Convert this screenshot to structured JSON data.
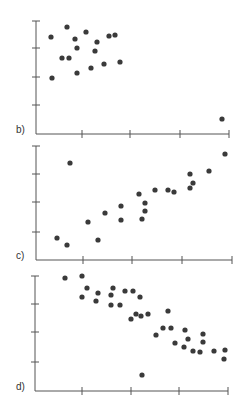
{
  "chart_data": [
    {
      "type": "scatter",
      "label": "b)",
      "title": "",
      "xlabel": "",
      "ylabel": "",
      "grid": false,
      "axis_px": {
        "x0": 36,
        "y0": 134,
        "x1": 229,
        "ytop": 21
      },
      "yticks_px": [
        21,
        48,
        77,
        105
      ],
      "xticks_px": [
        82,
        130,
        180,
        229
      ],
      "points_px": [
        [
          51,
          37
        ],
        [
          67,
          27
        ],
        [
          75,
          39
        ],
        [
          86,
          32
        ],
        [
          77,
          48
        ],
        [
          97,
          42
        ],
        [
          95,
          51
        ],
        [
          109,
          36
        ],
        [
          115,
          35
        ],
        [
          62,
          58
        ],
        [
          69,
          58
        ],
        [
          77,
          73
        ],
        [
          91,
          68
        ],
        [
          104,
          64
        ],
        [
          120,
          62
        ],
        [
          52,
          78
        ],
        [
          222,
          119
        ]
      ],
      "description": "Cluster of points in upper-left with one outlier at lower-right"
    },
    {
      "type": "scatter",
      "label": "c)",
      "title": "",
      "xlabel": "",
      "ylabel": "",
      "grid": false,
      "axis_px": {
        "x0": 36,
        "y0": 260,
        "x1": 232,
        "ytop": 146
      },
      "yticks_px": [
        146,
        174,
        202,
        232
      ],
      "xticks_px": [
        83,
        132,
        182,
        232
      ],
      "points_px": [
        [
          70,
          163
        ],
        [
          57,
          238
        ],
        [
          67,
          245
        ],
        [
          88,
          222
        ],
        [
          98,
          240
        ],
        [
          105,
          213
        ],
        [
          121,
          206
        ],
        [
          121,
          220
        ],
        [
          139,
          194
        ],
        [
          145,
          203
        ],
        [
          145,
          211
        ],
        [
          142,
          219
        ],
        [
          155,
          190
        ],
        [
          168,
          190
        ],
        [
          174,
          192
        ],
        [
          190,
          174
        ],
        [
          193,
          183
        ],
        [
          190,
          188
        ],
        [
          209,
          171
        ],
        [
          225,
          154
        ]
      ],
      "description": "Positive linear trend with one outlier at upper-left"
    },
    {
      "type": "scatter",
      "label": "d)",
      "title": "",
      "xlabel": "",
      "ylabel": "",
      "grid": false,
      "axis_px": {
        "x0": 35,
        "y0": 391,
        "x1": 228,
        "ytop": 276
      },
      "yticks_px": [
        276,
        304,
        332,
        362
      ],
      "xticks_px": [
        82,
        131,
        179,
        228
      ],
      "points_px": [
        [
          65,
          278
        ],
        [
          82,
          276
        ],
        [
          87,
          288
        ],
        [
          82,
          297
        ],
        [
          98,
          293
        ],
        [
          96,
          301
        ],
        [
          113,
          288
        ],
        [
          111,
          295
        ],
        [
          111,
          305
        ],
        [
          120,
          305
        ],
        [
          125,
          291
        ],
        [
          133,
          291
        ],
        [
          140,
          297
        ],
        [
          131,
          319
        ],
        [
          136,
          314
        ],
        [
          141,
          316
        ],
        [
          148,
          314
        ],
        [
          156,
          335
        ],
        [
          163,
          328
        ],
        [
          168,
          311
        ],
        [
          171,
          328
        ],
        [
          185,
          330
        ],
        [
          175,
          343
        ],
        [
          184,
          347
        ],
        [
          188,
          339
        ],
        [
          193,
          351
        ],
        [
          203,
          334
        ],
        [
          203,
          342
        ],
        [
          200,
          352
        ],
        [
          214,
          351
        ],
        [
          225,
          350
        ],
        [
          224,
          359
        ],
        [
          142,
          375
        ]
      ],
      "description": "Negative linear trend with one outlier below the trend"
    }
  ],
  "labels": {
    "b": "b)",
    "c": "c)",
    "d": "d)"
  }
}
